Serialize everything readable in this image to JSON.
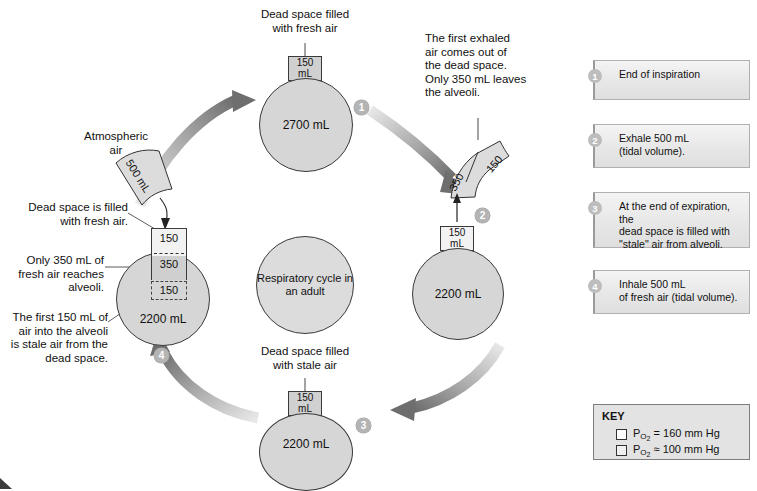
{
  "diagram": {
    "center_hub": "Respiratory\ncycle in\nan adult",
    "steps": [
      {
        "n": "1",
        "volume": "2700 mL",
        "dead_space_l1": "150",
        "dead_space_l2": "mL",
        "caption": "Dead space filled\nwith fresh air"
      },
      {
        "n": "2",
        "volume": "2200 mL",
        "dead_space_l1": "150",
        "dead_space_l2": "mL",
        "caption": "The first exhaled\nair comes out of\nthe dead space.\nOnly 350 mL leaves\nthe alveoli."
      },
      {
        "n": "3",
        "volume": "2200 mL",
        "dead_space_l1": "150",
        "dead_space_l2": "mL",
        "caption": "Dead space filled\nwith stale air"
      },
      {
        "n": "4",
        "volume": "2200 mL",
        "column_top": "150",
        "column_mid": "350",
        "column_dashed": "150",
        "caption_atmospheric": "Atmospheric\nair",
        "caption_dead_space": "Dead space is filled\nwith fresh air.",
        "caption_fresh": "Only 350 mL of\nfresh air reaches\nalveoli.",
        "caption_stale": "The first 150 mL of\nair into the alveoli\nis stale air from the\ndead space."
      }
    ],
    "exhaled_tube": {
      "upper": "150",
      "lower": "350"
    },
    "inhaled_tube": {
      "label": "500 mL"
    }
  },
  "legend": {
    "items": [
      {
        "n": "1",
        "text": "End of inspiration"
      },
      {
        "n": "2",
        "text": "Exhale 500 mL\n(tidal volume)."
      },
      {
        "n": "3",
        "text": "At the end of expiration, the\ndead space is filled with\n\"stale\" air from alveoli."
      },
      {
        "n": "4",
        "text": "Inhale 500 mL\nof fresh air (tidal volume)."
      }
    ]
  },
  "key": {
    "title": "KEY",
    "rows": [
      {
        "prefix": "P",
        "sub": "O",
        "sub2": "2",
        "value": " = 160 mm Hg",
        "swatch": "white"
      },
      {
        "prefix": "P",
        "sub": "O",
        "sub2": "2",
        "value": " ≈ 100 mm Hg",
        "swatch": "gray"
      }
    ],
    "row1_full": "PO2 = 160 mm Hg",
    "row2_full": "PO2 ≈ 100 mm Hg"
  },
  "colors": {
    "alveoli_fill": "#d6d6d6",
    "dead_space_stale": "#d0d0d0",
    "dead_space_fresh": "#f2f2f2",
    "arrow": "#7a7a7a",
    "badge": "#b4b4b4"
  }
}
